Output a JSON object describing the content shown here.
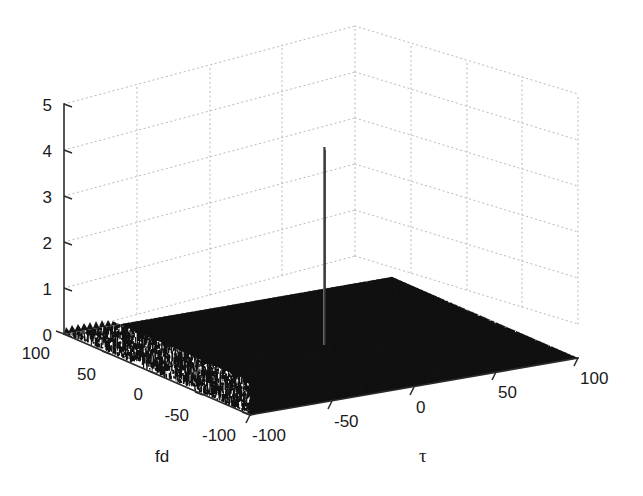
{
  "figure": {
    "background": "#ffffff",
    "axis_color": "#2b2b2b",
    "grid_color": "#b9b9b9",
    "surface_color": "#101010",
    "peak_color": "#3a3a3a"
  },
  "chart_data": {
    "type": "surface",
    "title": "",
    "subtitle": "",
    "xlabel": "τ",
    "ylabel": "fd",
    "zlabel": "",
    "grid": true,
    "legend": null,
    "projection": "3d",
    "xlim": [
      -100,
      100
    ],
    "ylim": [
      -100,
      100
    ],
    "zlim": [
      0,
      5
    ],
    "xticks": [
      -100,
      -50,
      0,
      50,
      100
    ],
    "xtick_labels": [
      "-100",
      "-50",
      "0",
      "50",
      "100"
    ],
    "yticks": [
      100,
      50,
      0,
      -50,
      -100
    ],
    "ytick_labels": [
      "100",
      "50",
      "0",
      "-50",
      "-100"
    ],
    "zticks": [
      0,
      1,
      2,
      3,
      4,
      5
    ],
    "ztick_labels": [
      "0",
      "1",
      "2",
      "3",
      "4",
      "5"
    ],
    "peak": {
      "x": 0,
      "y": 0,
      "z": 4.05,
      "label": ""
    },
    "noise_floor": {
      "mean": 0.18,
      "max": 0.55
    },
    "series": [
      {
        "name": "ambiguity surface",
        "color": "#101010",
        "z_range": [
          0.0,
          4.05
        ]
      }
    ]
  },
  "axes": {
    "z_axis_name": "z-axis",
    "y_axis_name": "fd-axis",
    "x_axis_name": "tau-axis",
    "x_axis_label": "τ",
    "y_axis_label": "fd"
  }
}
